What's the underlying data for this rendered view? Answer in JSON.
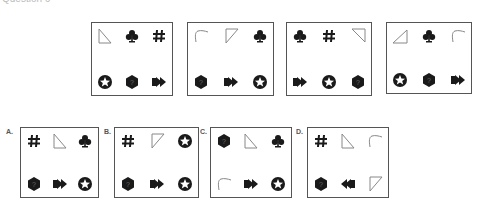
{
  "question": {
    "title": "Question 6"
  },
  "colors": {
    "border": "#555555",
    "symbol": "#1a1a1a",
    "outline": "#888888"
  },
  "sequence": [
    {
      "label": "figure-1",
      "top": [
        "triangle-right-bottom-left",
        "club",
        "hash"
      ],
      "bottom": [
        "star-circle",
        "hexagon-question",
        "arrow-right"
      ]
    },
    {
      "label": "figure-2",
      "top": [
        "curve",
        "triangle-down-left",
        "club"
      ],
      "bottom": [
        "hexagon-question",
        "arrow-right",
        "star-circle"
      ]
    },
    {
      "label": "figure-3",
      "top": [
        "club",
        "hash",
        "triangle-top-right"
      ],
      "bottom": [
        "arrow-right",
        "star-circle",
        "hexagon-question"
      ]
    },
    {
      "label": "figure-4",
      "top": [
        "triangle-up-right",
        "club",
        "curve"
      ],
      "bottom": [
        "star-circle",
        "hexagon-question",
        "arrow-right"
      ]
    }
  ],
  "options": [
    {
      "label": "A.",
      "top": [
        "hash",
        "triangle-right-bottom-left",
        "club"
      ],
      "bottom": [
        "hexagon-question",
        "arrow-right",
        "star-circle"
      ]
    },
    {
      "label": "B.",
      "top": [
        "hash",
        "triangle-down-left",
        "star-circle"
      ],
      "bottom": [
        "hexagon-question",
        "arrow-right",
        "star-circle"
      ]
    },
    {
      "label": "C.",
      "top": [
        "hexagon-question",
        "triangle-right-bottom-left",
        "club"
      ],
      "bottom": [
        "curve",
        "arrow-right",
        "star-circle"
      ]
    },
    {
      "label": "D.",
      "top": [
        "hash",
        "triangle-right-bottom-left",
        "curve"
      ],
      "bottom": [
        "hexagon-question",
        "arrow-left",
        "triangle-down-left"
      ]
    }
  ]
}
